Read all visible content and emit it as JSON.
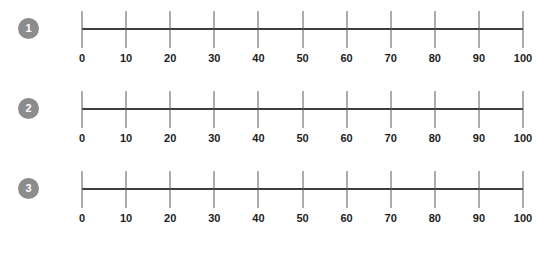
{
  "worksheet": {
    "title": "Blank number lines 0 to 100",
    "background_color": "#ffffff",
    "line_color": "#3d3d3d",
    "tick_color": "#5a5a5a",
    "label_color": "#1d1d1d",
    "badge_color": "#8c8c8c",
    "badge_text_color": "#ffffff"
  },
  "chart_data": {
    "type": "line",
    "title": "",
    "xlabel": "",
    "ylabel": "",
    "xlim": [
      0,
      100
    ],
    "grid": false,
    "legend": "none",
    "tick_interval": 10,
    "tick_values": [
      0,
      10,
      20,
      30,
      40,
      50,
      60,
      70,
      80,
      90,
      100
    ],
    "tick_labels": [
      "0",
      "10",
      "20",
      "30",
      "40",
      "50",
      "60",
      "70",
      "80",
      "90",
      "100"
    ],
    "series": [
      {
        "name": "number-line-1",
        "values": []
      },
      {
        "name": "number-line-2",
        "values": []
      },
      {
        "name": "number-line-3",
        "values": []
      }
    ]
  },
  "rows": [
    {
      "badge": "1",
      "ticks": [
        {
          "value": 0,
          "label": "0"
        },
        {
          "value": 10,
          "label": "10"
        },
        {
          "value": 20,
          "label": "20"
        },
        {
          "value": 30,
          "label": "30"
        },
        {
          "value": 40,
          "label": "40"
        },
        {
          "value": 50,
          "label": "50"
        },
        {
          "value": 60,
          "label": "60"
        },
        {
          "value": 70,
          "label": "70"
        },
        {
          "value": 80,
          "label": "80"
        },
        {
          "value": 90,
          "label": "90"
        },
        {
          "value": 100,
          "label": "100"
        }
      ]
    },
    {
      "badge": "2",
      "ticks": [
        {
          "value": 0,
          "label": "0"
        },
        {
          "value": 10,
          "label": "10"
        },
        {
          "value": 20,
          "label": "20"
        },
        {
          "value": 30,
          "label": "30"
        },
        {
          "value": 40,
          "label": "40"
        },
        {
          "value": 50,
          "label": "50"
        },
        {
          "value": 60,
          "label": "60"
        },
        {
          "value": 70,
          "label": "70"
        },
        {
          "value": 80,
          "label": "80"
        },
        {
          "value": 90,
          "label": "90"
        },
        {
          "value": 100,
          "label": "100"
        }
      ]
    },
    {
      "badge": "3",
      "ticks": [
        {
          "value": 0,
          "label": "0"
        },
        {
          "value": 10,
          "label": "10"
        },
        {
          "value": 20,
          "label": "20"
        },
        {
          "value": 30,
          "label": "30"
        },
        {
          "value": 40,
          "label": "40"
        },
        {
          "value": 50,
          "label": "50"
        },
        {
          "value": 60,
          "label": "60"
        },
        {
          "value": 70,
          "label": "70"
        },
        {
          "value": 80,
          "label": "80"
        },
        {
          "value": 90,
          "label": "90"
        },
        {
          "value": 100,
          "label": "100"
        }
      ]
    }
  ]
}
